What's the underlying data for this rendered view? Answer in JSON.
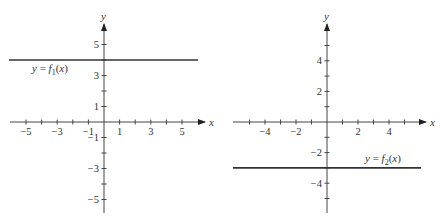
{
  "chart_data": [
    {
      "type": "line",
      "title": "",
      "xlabel": "x",
      "ylabel": "y",
      "xlim": [
        -6,
        6.5
      ],
      "ylim": [
        -6,
        6
      ],
      "x_tick_labels": [
        "-5",
        "-3",
        "-1",
        "1",
        "3",
        "5"
      ],
      "y_tick_labels": [
        "5",
        "3",
        "1",
        "-1",
        "-3",
        "-5"
      ],
      "x_ticks": [
        -5,
        -4,
        -3,
        -2,
        -1,
        1,
        2,
        3,
        4,
        5
      ],
      "y_ticks": [
        5,
        4,
        3,
        2,
        1,
        -1,
        -2,
        -3,
        -4,
        -5
      ],
      "series": [
        {
          "name": "y = f1(x)",
          "label_main": "y = f",
          "label_sub": "1",
          "label_tail": "(x)",
          "constant_y": 4,
          "x": [
            -6,
            6
          ],
          "values": [
            4,
            4
          ]
        }
      ]
    },
    {
      "type": "line",
      "title": "",
      "xlabel": "x",
      "ylabel": "y",
      "xlim": [
        -6,
        6.5
      ],
      "ylim": [
        -6,
        6
      ],
      "x_tick_labels": [
        "-4",
        "-2",
        "2",
        "4"
      ],
      "y_tick_labels": [
        "4",
        "2",
        "-2",
        "-4"
      ],
      "x_ticks": [
        -5,
        -4,
        -3,
        -2,
        -1,
        1,
        2,
        3,
        4,
        5
      ],
      "y_ticks": [
        5,
        4,
        3,
        2,
        1,
        -1,
        -2,
        -3,
        -4,
        -5
      ],
      "series": [
        {
          "name": "y = f2(x)",
          "label_main": "y = f",
          "label_sub": "2",
          "label_tail": "(x)",
          "constant_y": -3,
          "x": [
            -6,
            6
          ],
          "values": [
            -3,
            -3
          ]
        }
      ]
    }
  ],
  "graphs": [
    {
      "axis_label_x": "x",
      "axis_label_y": "y",
      "function_label": {
        "pre": "y = ",
        "f": "f",
        "sub": "1",
        "post": "(x)"
      }
    },
    {
      "axis_label_x": "x",
      "axis_label_y": "y",
      "function_label": {
        "pre": "y = ",
        "f": "f",
        "sub": "2",
        "post": "(x)"
      }
    }
  ]
}
